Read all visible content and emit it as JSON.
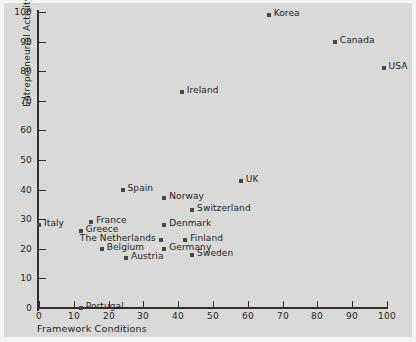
{
  "chart_data": {
    "type": "scatter",
    "title": "",
    "xlabel": "Framework Conditions",
    "ylabel": "Entrepreneurial Activity",
    "xlim": [
      0,
      100
    ],
    "ylim": [
      0,
      100
    ],
    "xticks": [
      0,
      10,
      20,
      30,
      40,
      50,
      60,
      70,
      80,
      90,
      100
    ],
    "yticks": [
      0,
      10,
      20,
      30,
      40,
      50,
      60,
      70,
      80,
      90,
      100
    ],
    "grid": false,
    "legend": null,
    "marker_color": "#474747",
    "background_color": "#d9d9d7",
    "points": [
      {
        "label": "Korea",
        "x": 66,
        "y": 99,
        "label_side": "right"
      },
      {
        "label": "Canada",
        "x": 85,
        "y": 90,
        "label_side": "right"
      },
      {
        "label": "USA",
        "x": 99,
        "y": 81,
        "label_side": "right"
      },
      {
        "label": "Ireland",
        "x": 41,
        "y": 73,
        "label_side": "right"
      },
      {
        "label": "UK",
        "x": 58,
        "y": 43,
        "label_side": "right"
      },
      {
        "label": "Spain",
        "x": 24,
        "y": 40,
        "label_side": "right"
      },
      {
        "label": "Norway",
        "x": 36,
        "y": 37,
        "label_side": "right"
      },
      {
        "label": "Switzerland",
        "x": 44,
        "y": 33,
        "label_side": "right"
      },
      {
        "label": "Italy",
        "x": 0,
        "y": 28,
        "label_side": "right"
      },
      {
        "label": "France",
        "x": 15,
        "y": 29,
        "label_side": "right"
      },
      {
        "label": "Denmark",
        "x": 36,
        "y": 28,
        "label_side": "right"
      },
      {
        "label": "Greece",
        "x": 12,
        "y": 26,
        "label_side": "right"
      },
      {
        "label": "The Netherlands",
        "x": 35,
        "y": 23,
        "label_side": "left"
      },
      {
        "label": "Finland",
        "x": 42,
        "y": 23,
        "label_side": "right"
      },
      {
        "label": "Belgium",
        "x": 18,
        "y": 20,
        "label_side": "right"
      },
      {
        "label": "Germany",
        "x": 36,
        "y": 20,
        "label_side": "right"
      },
      {
        "label": "Austria",
        "x": 25,
        "y": 17,
        "label_side": "right"
      },
      {
        "label": "Sweden",
        "x": 44,
        "y": 18,
        "label_side": "right"
      },
      {
        "label": "Portugal",
        "x": 12,
        "y": 0,
        "label_side": "right"
      }
    ]
  }
}
